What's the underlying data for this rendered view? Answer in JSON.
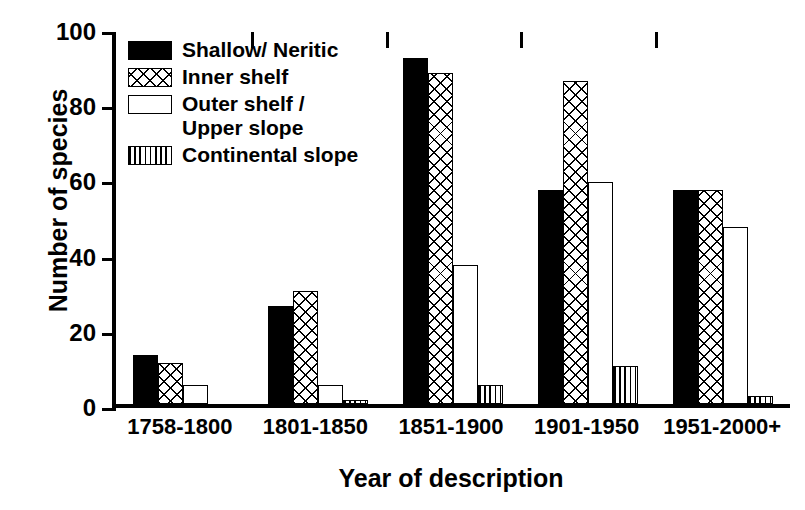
{
  "chart_data": {
    "type": "bar",
    "title": "",
    "xlabel": "Year of description",
    "ylabel": "Number of species",
    "categories": [
      "1758-1800",
      "1801-1850",
      "1851-1900",
      "1901-1950",
      "1951-2000+"
    ],
    "series": [
      {
        "name": "Shallow/ Neritic",
        "pattern": "solid",
        "values": [
          13,
          26,
          92,
          57,
          57
        ]
      },
      {
        "name": "Inner shelf",
        "pattern": "hatch",
        "values": [
          11,
          30,
          88,
          86,
          57
        ]
      },
      {
        "name": "Outer shelf /\nUpper slope",
        "pattern": "open",
        "values": [
          5,
          5,
          37,
          59,
          47
        ]
      },
      {
        "name": "Continental slope",
        "pattern": "vstripe",
        "values": [
          0,
          1,
          5,
          10,
          2
        ]
      }
    ],
    "ylim": [
      0,
      100
    ],
    "yticks": [
      0,
      20,
      40,
      60,
      80,
      100
    ],
    "ytick_labels": [
      "0",
      "20",
      "40",
      "60",
      "80",
      "100"
    ],
    "grid": false,
    "legend_position": "top-left",
    "axis_color": "#000000",
    "background_color": "#ffffff"
  },
  "legend": {
    "entries": [
      {
        "label": "Shallow/ Neritic"
      },
      {
        "label": "Inner shelf"
      },
      {
        "label": "Outer shelf /\nUpper slope"
      },
      {
        "label": "Continental slope"
      }
    ]
  },
  "axes": {
    "ytick_labels": [
      "100",
      "80",
      "60",
      "40",
      "20",
      "0"
    ]
  }
}
